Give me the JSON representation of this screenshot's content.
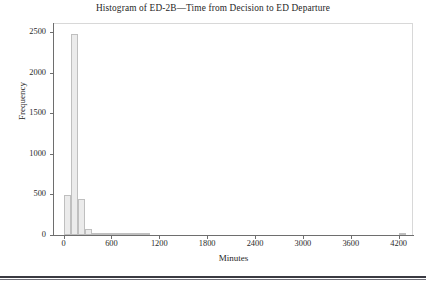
{
  "figure": {
    "title": "Histogram of ED-2B—Time from Decision to ED Departure",
    "bottom_rule": true
  },
  "axes": {
    "xlabel": "Minutes",
    "ylabel": "Frequency",
    "xticks": [
      "0",
      "600",
      "1200",
      "1800",
      "2400",
      "3000",
      "3600",
      "4200"
    ],
    "yticks": [
      "0",
      "500",
      "1000",
      "1500",
      "2000",
      "2500"
    ]
  },
  "style": {
    "bar_fill": "#ebebeb",
    "bar_edge": "#bfbfbf",
    "axis_color": "#6e6e6e",
    "frame_color": "#d8d8d8",
    "text_color": "#2b2b2b",
    "rule_color": "#3a3a42"
  },
  "chart_data": {
    "type": "bar",
    "title": "Histogram of ED-2B—Time from Decision to ED Departure",
    "xlabel": "Minutes",
    "ylabel": "Frequency",
    "xlim": [
      -120,
      4380
    ],
    "ylim": [
      0,
      2600
    ],
    "grid": false,
    "legend": null,
    "bin_width": 90,
    "bins": [
      {
        "x0": 0,
        "x1": 90,
        "value": 498
      },
      {
        "x0": 90,
        "x1": 180,
        "value": 2480
      },
      {
        "x0": 180,
        "x1": 270,
        "value": 440
      },
      {
        "x0": 270,
        "x1": 360,
        "value": 78
      },
      {
        "x0": 360,
        "x1": 450,
        "value": 22
      },
      {
        "x0": 450,
        "x1": 540,
        "value": 9
      },
      {
        "x0": 540,
        "x1": 630,
        "value": 5
      },
      {
        "x0": 630,
        "x1": 720,
        "value": 3
      },
      {
        "x0": 720,
        "x1": 810,
        "value": 2
      },
      {
        "x0": 810,
        "x1": 900,
        "value": 2
      },
      {
        "x0": 900,
        "x1": 990,
        "value": 1
      },
      {
        "x0": 990,
        "x1": 1080,
        "value": 1
      },
      {
        "x0": 4200,
        "x1": 4290,
        "value": 1
      }
    ],
    "categories": [
      "0-90",
      "90-180",
      "180-270",
      "270-360",
      "360-450",
      "450-540",
      "540-630",
      "630-720",
      "720-810",
      "810-900",
      "900-990",
      "990-1080",
      "4200-4290"
    ],
    "values": [
      498,
      2480,
      440,
      78,
      22,
      9,
      5,
      3,
      2,
      2,
      1,
      1,
      1
    ]
  }
}
